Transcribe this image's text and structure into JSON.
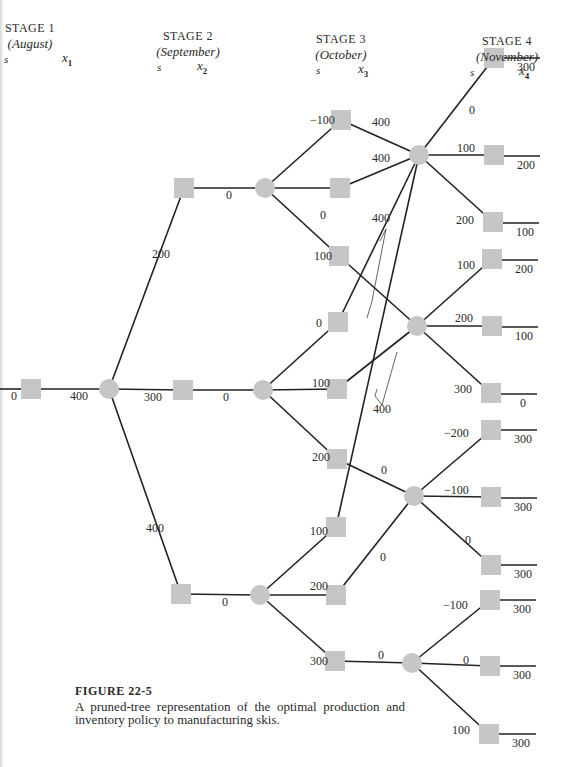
{
  "stages": [
    {
      "title": "STAGE 1",
      "month": "(August)",
      "s_label": "s",
      "x_label": "x",
      "x_sub": "1",
      "cx": 30,
      "top": 21,
      "s_x": 4,
      "x_x": 62
    },
    {
      "title": "STAGE 2",
      "month": "(September)",
      "s_label": "s",
      "x_label": "x",
      "x_sub": "2",
      "cx": 188,
      "top": 29,
      "s_x": 157,
      "x_x": 197
    },
    {
      "title": "STAGE 3",
      "month": "(October)",
      "s_label": "s",
      "x_label": "x",
      "x_sub": "3",
      "cx": 341,
      "top": 32,
      "s_x": 316,
      "x_x": 358
    },
    {
      "title": "STAGE 4",
      "month": "(November)",
      "s_label": "s",
      "x_label": "x",
      "x_sub": "4",
      "cx": 507,
      "top": 34,
      "s_x": 470,
      "x_x": 519
    }
  ],
  "colors": {
    "node_fill": "#c6c6c6",
    "line": "#222222",
    "text": "#2a2a2a"
  },
  "chart_data": {
    "type": "tree",
    "title": "FIGURE 22-5",
    "caption": "A pruned-tree representation of the optimal production and inventory policy to manufacturing skis.",
    "squares": [
      {
        "id": "s1",
        "x": 31,
        "y": 389
      },
      {
        "id": "s2a",
        "x": 184,
        "y": 188
      },
      {
        "id": "s2b",
        "x": 183,
        "y": 390
      },
      {
        "id": "s2c",
        "x": 181,
        "y": 594
      },
      {
        "id": "s3a",
        "x": 341,
        "y": 120
      },
      {
        "id": "s3b",
        "x": 340,
        "y": 188
      },
      {
        "id": "s3c",
        "x": 339,
        "y": 256
      },
      {
        "id": "s3d",
        "x": 338,
        "y": 322
      },
      {
        "id": "s3e",
        "x": 337,
        "y": 389
      },
      {
        "id": "s3f",
        "x": 337,
        "y": 459
      },
      {
        "id": "s3g",
        "x": 336,
        "y": 527
      },
      {
        "id": "s3h",
        "x": 336,
        "y": 595
      },
      {
        "id": "s3i",
        "x": 335,
        "y": 661
      },
      {
        "id": "s4a",
        "x": 494,
        "y": 58
      },
      {
        "id": "s4b",
        "x": 494,
        "y": 155
      },
      {
        "id": "s4c",
        "x": 493,
        "y": 222
      },
      {
        "id": "s4d",
        "x": 492,
        "y": 259
      },
      {
        "id": "s4e",
        "x": 492,
        "y": 326
      },
      {
        "id": "s4f",
        "x": 491,
        "y": 393
      },
      {
        "id": "s4g",
        "x": 491,
        "y": 430
      },
      {
        "id": "s4h",
        "x": 491,
        "y": 497
      },
      {
        "id": "s4i",
        "x": 491,
        "y": 565
      },
      {
        "id": "s4j",
        "x": 490,
        "y": 600
      },
      {
        "id": "s4k",
        "x": 490,
        "y": 666
      },
      {
        "id": "s4l",
        "x": 489,
        "y": 734
      }
    ],
    "circles": [
      {
        "id": "c1",
        "x": 109,
        "y": 389
      },
      {
        "id": "c2a",
        "x": 265,
        "y": 188
      },
      {
        "id": "c2b",
        "x": 263,
        "y": 390
      },
      {
        "id": "c2c",
        "x": 260,
        "y": 595
      },
      {
        "id": "c3a",
        "x": 419,
        "y": 155
      },
      {
        "id": "c3b",
        "x": 417,
        "y": 326
      },
      {
        "id": "c3c",
        "x": 414,
        "y": 496
      },
      {
        "id": "c3d",
        "x": 412,
        "y": 663
      }
    ],
    "edges": [
      {
        "from": [
          0,
          389
        ],
        "to": [
          31,
          389
        ]
      },
      {
        "from": [
          31,
          389
        ],
        "to": [
          109,
          389
        ]
      },
      {
        "from": [
          109,
          389
        ],
        "to": [
          184,
          188
        ]
      },
      {
        "from": [
          109,
          389
        ],
        "to": [
          183,
          390
        ]
      },
      {
        "from": [
          109,
          389
        ],
        "to": [
          181,
          594
        ]
      },
      {
        "from": [
          184,
          188
        ],
        "to": [
          265,
          188
        ]
      },
      {
        "from": [
          183,
          390
        ],
        "to": [
          263,
          390
        ]
      },
      {
        "from": [
          181,
          594
        ],
        "to": [
          260,
          595
        ]
      },
      {
        "from": [
          265,
          188
        ],
        "to": [
          341,
          120
        ]
      },
      {
        "from": [
          265,
          188
        ],
        "to": [
          340,
          188
        ]
      },
      {
        "from": [
          265,
          188
        ],
        "to": [
          339,
          256
        ]
      },
      {
        "from": [
          263,
          390
        ],
        "to": [
          338,
          322
        ]
      },
      {
        "from": [
          263,
          390
        ],
        "to": [
          337,
          389
        ]
      },
      {
        "from": [
          263,
          390
        ],
        "to": [
          337,
          459
        ]
      },
      {
        "from": [
          260,
          595
        ],
        "to": [
          336,
          527
        ]
      },
      {
        "from": [
          260,
          595
        ],
        "to": [
          336,
          595
        ]
      },
      {
        "from": [
          260,
          595
        ],
        "to": [
          335,
          661
        ]
      },
      {
        "from": [
          341,
          120
        ],
        "to": [
          419,
          155
        ]
      },
      {
        "from": [
          340,
          188
        ],
        "to": [
          419,
          155
        ]
      },
      {
        "from": [
          338,
          322
        ],
        "to": [
          419,
          155
        ]
      },
      {
        "from": [
          336,
          527
        ],
        "to": [
          419,
          155
        ]
      },
      {
        "from": [
          339,
          256
        ],
        "to": [
          417,
          326
        ]
      },
      {
        "from": [
          337,
          389
        ],
        "to": [
          417,
          326
        ]
      },
      {
        "from": [
          337,
          459
        ],
        "to": [
          414,
          496
        ]
      },
      {
        "from": [
          336,
          595
        ],
        "to": [
          414,
          496
        ]
      },
      {
        "from": [
          335,
          661
        ],
        "to": [
          412,
          663
        ]
      },
      {
        "from": [
          419,
          155
        ],
        "to": [
          494,
          58
        ]
      },
      {
        "from": [
          419,
          155
        ],
        "to": [
          494,
          155
        ]
      },
      {
        "from": [
          419,
          155
        ],
        "to": [
          493,
          222
        ]
      },
      {
        "from": [
          417,
          326
        ],
        "to": [
          492,
          259
        ]
      },
      {
        "from": [
          417,
          326
        ],
        "to": [
          492,
          326
        ]
      },
      {
        "from": [
          417,
          326
        ],
        "to": [
          491,
          393
        ]
      },
      {
        "from": [
          414,
          496
        ],
        "to": [
          491,
          430
        ]
      },
      {
        "from": [
          414,
          496
        ],
        "to": [
          491,
          497
        ]
      },
      {
        "from": [
          414,
          496
        ],
        "to": [
          491,
          565
        ]
      },
      {
        "from": [
          412,
          663
        ],
        "to": [
          490,
          600
        ]
      },
      {
        "from": [
          412,
          663
        ],
        "to": [
          490,
          666
        ]
      },
      {
        "from": [
          412,
          663
        ],
        "to": [
          489,
          734
        ]
      }
    ],
    "terminal_lines": [
      {
        "x1": 504,
        "y": 58,
        "x2": 540,
        "value": "300"
      },
      {
        "x1": 504,
        "y": 156,
        "x2": 540,
        "value": "200"
      },
      {
        "x1": 503,
        "y": 223,
        "x2": 539,
        "value": "100"
      },
      {
        "x1": 502,
        "y": 260,
        "x2": 538,
        "value": "200"
      },
      {
        "x1": 502,
        "y": 327,
        "x2": 538,
        "value": "100"
      },
      {
        "x1": 501,
        "y": 394,
        "x2": 537,
        "value": "0"
      },
      {
        "x1": 501,
        "y": 430,
        "x2": 537,
        "value": "300"
      },
      {
        "x1": 501,
        "y": 498,
        "x2": 537,
        "value": "300"
      },
      {
        "x1": 501,
        "y": 565,
        "x2": 537,
        "value": "300"
      },
      {
        "x1": 500,
        "y": 600,
        "x2": 536,
        "value": "300"
      },
      {
        "x1": 500,
        "y": 666,
        "x2": 536,
        "value": "300"
      },
      {
        "x1": 499,
        "y": 734,
        "x2": 536,
        "value": "300"
      }
    ],
    "labels": [
      {
        "text": "0",
        "x": 11,
        "y": 400
      },
      {
        "text": "400",
        "x": 70,
        "y": 400
      },
      {
        "text": "300",
        "x": 144,
        "y": 401
      },
      {
        "text": "200",
        "x": 152,
        "y": 258
      },
      {
        "text": "400",
        "x": 146,
        "y": 532
      },
      {
        "text": "0",
        "x": 226,
        "y": 199
      },
      {
        "text": "0",
        "x": 223,
        "y": 401
      },
      {
        "text": "0",
        "x": 222,
        "y": 606
      },
      {
        "text": "−100",
        "x": 310,
        "y": 124
      },
      {
        "text": "0",
        "x": 320,
        "y": 219
      },
      {
        "text": "100",
        "x": 314,
        "y": 260
      },
      {
        "text": "0",
        "x": 316,
        "y": 327
      },
      {
        "text": "100",
        "x": 312,
        "y": 387
      },
      {
        "text": "200",
        "x": 312,
        "y": 461
      },
      {
        "text": "100",
        "x": 310,
        "y": 535
      },
      {
        "text": "200",
        "x": 310,
        "y": 590
      },
      {
        "text": "300",
        "x": 310,
        "y": 665
      },
      {
        "text": "400",
        "x": 372,
        "y": 126
      },
      {
        "text": "400",
        "x": 372,
        "y": 162
      },
      {
        "text": "400",
        "x": 372,
        "y": 222
      },
      {
        "text": "400",
        "x": 373,
        "y": 413
      },
      {
        "text": "0",
        "x": 381,
        "y": 474
      },
      {
        "text": "0",
        "x": 380,
        "y": 561
      },
      {
        "text": "0",
        "x": 378,
        "y": 659
      },
      {
        "text": "0",
        "x": 469,
        "y": 114
      },
      {
        "text": "100",
        "x": 457,
        "y": 152
      },
      {
        "text": "200",
        "x": 456,
        "y": 224
      },
      {
        "text": "100",
        "x": 457,
        "y": 269
      },
      {
        "text": "200",
        "x": 455,
        "y": 322
      },
      {
        "text": "300",
        "x": 454,
        "y": 393
      },
      {
        "text": "−200",
        "x": 444,
        "y": 437
      },
      {
        "text": "−100",
        "x": 444,
        "y": 494
      },
      {
        "text": "0",
        "x": 465,
        "y": 544
      },
      {
        "text": "−100",
        "x": 443,
        "y": 609
      },
      {
        "text": "0",
        "x": 463,
        "y": 664
      },
      {
        "text": "100",
        "x": 452,
        "y": 734
      }
    ],
    "brackets": [
      {
        "points": "380,241 386,229 372,301 367,318"
      },
      {
        "points": "397,352 382,405 375,396 377,389"
      }
    ]
  },
  "caption": {
    "title": "FIGURE 22-5",
    "text": "A pruned-tree representation of the optimal production and inventory policy to manufacturing skis."
  }
}
